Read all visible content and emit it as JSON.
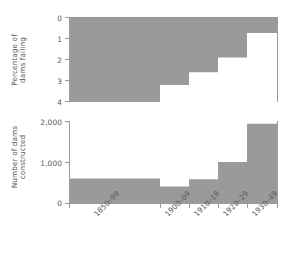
{
  "figure": {
    "background": "#ffffff",
    "fill_color": "#9a9a9c",
    "axis_color": "#9b9b9d",
    "text_color": "#58585a"
  },
  "x_axis": {
    "tick_labels": [
      "1850–99",
      "1900–09",
      "1910–19",
      "1920–29",
      "1930–49"
    ]
  },
  "top_panel": {
    "y_title_line1": "Percentage of",
    "y_title_line2": "dams failing",
    "y_ticks": [
      "0",
      "1",
      "2",
      "3",
      "4"
    ]
  },
  "bottom_panel": {
    "y_title_line1": "Number of dams",
    "y_title_line2": "constructed",
    "y_ticks": [
      "2,000",
      "1,000",
      "0"
    ]
  },
  "chart_data": [
    {
      "type": "area",
      "id": "percentage-of-dams-failing",
      "title": "",
      "xlabel": "",
      "ylabel": "Percentage of dams failing",
      "orientation": "step",
      "y_inverted": true,
      "ylim": [
        0,
        4
      ],
      "yticks": [
        0,
        1,
        2,
        3,
        4
      ],
      "grid": false,
      "legend": "none",
      "categories": [
        "1850–99",
        "1900–09",
        "1910–19",
        "1920–29",
        "1930–49"
      ],
      "values": [
        4.0,
        3.2,
        2.6,
        1.9,
        0.75
      ],
      "note": "Gray region extends downward from 0 at top to the value; step-style, declining over time."
    },
    {
      "type": "bar",
      "id": "number-of-dams-constructed",
      "title": "",
      "xlabel": "",
      "ylabel": "Number of dams constructed",
      "ylim": [
        0,
        2000
      ],
      "yticks": [
        0,
        1000,
        2000
      ],
      "ytick_labels": [
        "0",
        "1,000",
        "2,000"
      ],
      "grid": false,
      "legend": "none",
      "categories": [
        "1850–99",
        "1900–09",
        "1910–19",
        "1920–29",
        "1930–49"
      ],
      "values": [
        600,
        400,
        580,
        1000,
        1930
      ],
      "note": "Gray bars rise from 0 baseline; unequal category widths matching axis tick spacing."
    }
  ]
}
